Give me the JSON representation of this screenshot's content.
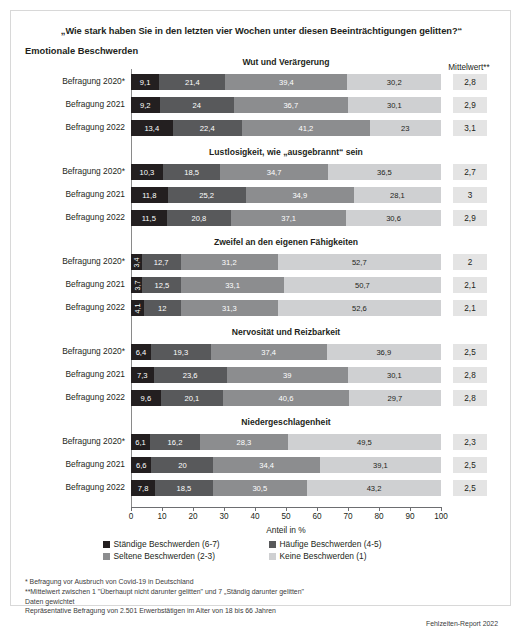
{
  "figure": {
    "main_title": "„Wie stark haben Sie in den letzten vier Wochen unter diesen Beeinträchtigungen gelitten?“",
    "section_label": "Emotionale Beschwerden",
    "mittelwert_header": "Mittelwert**",
    "axis_caption": "Anteil in %",
    "source": "Fehlzeiten-Report 2022"
  },
  "footnotes": [
    "*  Befragung vor Ausbruch von Covid-19 in Deutschland",
    "**Mittelwert zwischen 1 \"Überhaupt nicht darunter gelitten\" und 7 „Ständig darunter gelitten\"",
    "Daten gewichtet",
    "Repräsentative Befragung von 2.501 Erwerbstätigen im Alter von 18 bis 66 Jahren"
  ],
  "legend": [
    {
      "label": "Ständige Beschwerden (6-7)",
      "color": "#231f20"
    },
    {
      "label": "Häufige Beschwerden (4-5)",
      "color": "#58595b"
    },
    {
      "label": "Seltene Beschwerden (2-3)",
      "color": "#8c8d8f"
    },
    {
      "label": "Keine Beschwerden (1)",
      "color": "#cfd0d2"
    }
  ],
  "colors": {
    "staendige": "#231f20",
    "haeufige": "#58595b",
    "seltene": "#8c8d8f",
    "keine": "#cfd0d2",
    "mean_box": "#e4e4e4",
    "axis": "#6d6e71"
  },
  "axis": {
    "ticks": [
      0,
      10,
      20,
      30,
      40,
      50,
      60,
      70,
      80,
      90,
      100
    ],
    "min": 0,
    "max": 100
  },
  "chart_data": {
    "type": "bar",
    "title": "„Wie stark haben Sie in den letzten vier Wochen unter diesen Beeinträchtigungen gelitten?“",
    "subtitle": "Emotionale Beschwerden",
    "xlabel": "Anteil in %",
    "ylabel": "",
    "xlim": [
      0,
      100
    ],
    "orientation": "horizontal",
    "stacked": true,
    "grid": false,
    "legend_position": "bottom",
    "series": [
      {
        "name": "Ständige Beschwerden (6-7)",
        "color": "#231f20"
      },
      {
        "name": "Häufige Beschwerden (4-5)",
        "color": "#58595b"
      },
      {
        "name": "Seltene Beschwerden (2-3)",
        "color": "#8c8d8f"
      },
      {
        "name": "Keine Beschwerden (1)",
        "color": "#cfd0d2"
      }
    ],
    "groups": [
      {
        "title": "Wut und Verärgerung",
        "rows": [
          {
            "label": "Befragung 2020*",
            "values": [
              9.1,
              21.4,
              39.4,
              30.2
            ],
            "value_labels": [
              "9,1",
              "21,4",
              "39,4",
              "30,2"
            ],
            "mean": "2,8"
          },
          {
            "label": "Befragung 2021",
            "values": [
              9.2,
              24,
              36.7,
              30.1
            ],
            "value_labels": [
              "9,2",
              "24",
              "36,7",
              "30,1"
            ],
            "mean": "2,9"
          },
          {
            "label": "Befragung 2022",
            "values": [
              13.4,
              22.4,
              41.2,
              23
            ],
            "value_labels": [
              "13,4",
              "22,4",
              "41,2",
              "23"
            ],
            "mean": "3,1"
          }
        ]
      },
      {
        "title": "Lustlosigkeit, wie „ausgebrannt“ sein",
        "rows": [
          {
            "label": "Befragung 2020*",
            "values": [
              10.3,
              18.5,
              34.7,
              36.5
            ],
            "value_labels": [
              "10,3",
              "18,5",
              "34,7",
              "36,5"
            ],
            "mean": "2,7"
          },
          {
            "label": "Befragung 2021",
            "values": [
              11.8,
              25.2,
              34.9,
              28.1
            ],
            "value_labels": [
              "11,8",
              "25,2",
              "34,9",
              "28,1"
            ],
            "mean": "3"
          },
          {
            "label": "Befragung 2022",
            "values": [
              11.5,
              20.8,
              37.1,
              30.6
            ],
            "value_labels": [
              "11,5",
              "20,8",
              "37,1",
              "30,6"
            ],
            "mean": "2,9"
          }
        ]
      },
      {
        "title": "Zweifel an den eigenen Fähigkeiten",
        "rows": [
          {
            "label": "Befragung 2020*",
            "values": [
              3.4,
              12.7,
              31.2,
              52.7
            ],
            "value_labels": [
              "3,4",
              "12,7",
              "31,2",
              "52,7"
            ],
            "mean": "2"
          },
          {
            "label": "Befragung 2021",
            "values": [
              3.7,
              12.5,
              33.1,
              50.7
            ],
            "value_labels": [
              "3,7",
              "12,5",
              "33,1",
              "50,7"
            ],
            "mean": "2,1"
          },
          {
            "label": "Befragung 2022",
            "values": [
              4.1,
              12,
              31.3,
              52.6
            ],
            "value_labels": [
              "4,1",
              "12",
              "31,3",
              "52,6"
            ],
            "mean": "2,1"
          }
        ]
      },
      {
        "title": "Nervosität und Reizbarkeit",
        "rows": [
          {
            "label": "Befragung 2020*",
            "values": [
              6.4,
              19.3,
              37.4,
              36.9
            ],
            "value_labels": [
              "6,4",
              "19,3",
              "37,4",
              "36,9"
            ],
            "mean": "2,5"
          },
          {
            "label": "Befragung 2021",
            "values": [
              7.3,
              23.6,
              39,
              30.1
            ],
            "value_labels": [
              "7,3",
              "23,6",
              "39",
              "30,1"
            ],
            "mean": "2,8"
          },
          {
            "label": "Befragung 2022",
            "values": [
              9.6,
              20.1,
              40.6,
              29.7
            ],
            "value_labels": [
              "9,6",
              "20,1",
              "40,6",
              "29,7"
            ],
            "mean": "2,8"
          }
        ]
      },
      {
        "title": "Niedergeschlagenheit",
        "rows": [
          {
            "label": "Befragung 2020*",
            "values": [
              6.1,
              16.2,
              28.3,
              49.5
            ],
            "value_labels": [
              "6,1",
              "16,2",
              "28,3",
              "49,5"
            ],
            "mean": "2,3"
          },
          {
            "label": "Befragung 2021",
            "values": [
              6.6,
              20,
              34.4,
              39.1
            ],
            "value_labels": [
              "6,6",
              "20",
              "34,4",
              "39,1"
            ],
            "mean": "2,5"
          },
          {
            "label": "Befragung 2022",
            "values": [
              7.8,
              18.5,
              30.5,
              43.2
            ],
            "value_labels": [
              "7,8",
              "18,5",
              "30,5",
              "43,2"
            ],
            "mean": "2,5"
          }
        ]
      }
    ]
  }
}
